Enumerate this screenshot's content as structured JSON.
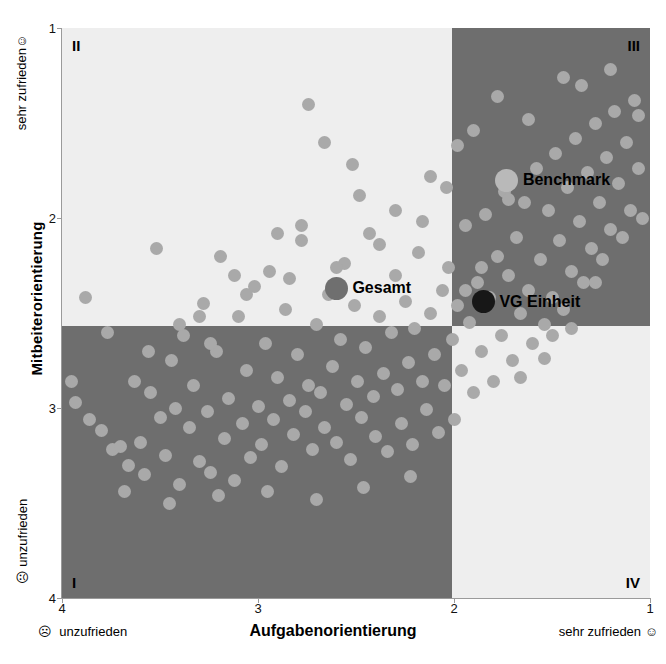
{
  "chart_data": {
    "type": "scatter",
    "title": "",
    "xlabel": "Aufgabenorientierung",
    "ylabel": "Mitbeiterorientierung",
    "xlim": [
      4,
      1
    ],
    "ylim": [
      4,
      1
    ],
    "x_ticks": [
      "4",
      "3",
      "2",
      "1"
    ],
    "y_ticks": [
      "1",
      "2",
      "3",
      "4"
    ],
    "x_tick_values": [
      4,
      3,
      2,
      1
    ],
    "y_tick_values": [
      1,
      2,
      3,
      4
    ],
    "grid": false,
    "axis_notes": {
      "x_left": "unzufrieden",
      "x_right": "sehr zufrieden",
      "y_top": "sehr zufrieden",
      "y_bottom": "unzufrieden",
      "smiley_sad": "☹",
      "smiley_happy": "☺"
    },
    "quadrants": [
      {
        "id": "II",
        "label": "II",
        "shade": "light",
        "color": "#eeeeee",
        "x_range": [
          4,
          2
        ],
        "y_range": [
          1,
          2.5
        ]
      },
      {
        "id": "III",
        "label": "III",
        "shade": "dark",
        "color": "#6e6e6e",
        "x_range": [
          2,
          1
        ],
        "y_range": [
          1,
          2.5
        ]
      },
      {
        "id": "I",
        "label": "I",
        "shade": "dark",
        "color": "#6e6e6e",
        "x_range": [
          4,
          2
        ],
        "y_range": [
          2.5,
          4
        ]
      },
      {
        "id": "IV",
        "label": "IV",
        "shade": "light",
        "color": "#eeeeee",
        "x_range": [
          2,
          1
        ],
        "y_range": [
          2.5,
          4
        ]
      }
    ],
    "point_color": "#a9a9a9",
    "series": [
      {
        "name": "Einheiten",
        "color": "#a9a9a9",
        "points": [
          [
            3.95,
            2.86
          ],
          [
            3.93,
            2.97
          ],
          [
            3.88,
            2.42
          ],
          [
            3.8,
            3.12
          ],
          [
            3.77,
            2.6
          ],
          [
            3.74,
            3.22
          ],
          [
            3.7,
            3.2
          ],
          [
            3.66,
            3.3
          ],
          [
            3.63,
            2.86
          ],
          [
            3.6,
            3.18
          ],
          [
            3.58,
            3.35
          ],
          [
            3.55,
            2.92
          ],
          [
            3.52,
            2.16
          ],
          [
            3.5,
            3.05
          ],
          [
            3.47,
            3.25
          ],
          [
            3.44,
            2.75
          ],
          [
            3.42,
            3.0
          ],
          [
            3.4,
            3.4
          ],
          [
            3.38,
            2.62
          ],
          [
            3.35,
            3.1
          ],
          [
            3.33,
            2.88
          ],
          [
            3.3,
            3.28
          ],
          [
            3.28,
            2.45
          ],
          [
            3.26,
            3.02
          ],
          [
            3.24,
            3.34
          ],
          [
            3.21,
            2.7
          ],
          [
            3.19,
            2.2
          ],
          [
            3.17,
            3.16
          ],
          [
            3.15,
            2.95
          ],
          [
            3.12,
            3.38
          ],
          [
            3.1,
            2.52
          ],
          [
            3.08,
            3.08
          ],
          [
            3.06,
            2.8
          ],
          [
            3.04,
            3.26
          ],
          [
            3.02,
            2.36
          ],
          [
            3.0,
            2.99
          ],
          [
            2.98,
            3.19
          ],
          [
            2.96,
            2.66
          ],
          [
            2.94,
            2.28
          ],
          [
            2.92,
            3.06
          ],
          [
            2.9,
            2.84
          ],
          [
            2.88,
            3.31
          ],
          [
            2.86,
            2.48
          ],
          [
            2.84,
            2.96
          ],
          [
            2.82,
            3.14
          ],
          [
            2.8,
            2.72
          ],
          [
            2.78,
            2.12
          ],
          [
            2.76,
            3.02
          ],
          [
            2.74,
            2.88
          ],
          [
            2.72,
            3.22
          ],
          [
            2.7,
            2.56
          ],
          [
            2.68,
            2.92
          ],
          [
            2.66,
            3.1
          ],
          [
            2.64,
            2.4
          ],
          [
            2.62,
            2.78
          ],
          [
            2.6,
            3.18
          ],
          [
            2.58,
            2.64
          ],
          [
            2.56,
            2.24
          ],
          [
            2.55,
            2.98
          ],
          [
            2.53,
            3.27
          ],
          [
            2.51,
            2.46
          ],
          [
            2.49,
            2.86
          ],
          [
            2.47,
            3.05
          ],
          [
            2.45,
            2.68
          ],
          [
            2.43,
            2.08
          ],
          [
            2.41,
            2.94
          ],
          [
            2.4,
            3.15
          ],
          [
            2.38,
            2.52
          ],
          [
            2.36,
            2.82
          ],
          [
            2.34,
            3.23
          ],
          [
            2.32,
            2.6
          ],
          [
            2.3,
            2.3
          ],
          [
            2.29,
            2.9
          ],
          [
            2.27,
            3.08
          ],
          [
            2.25,
            2.44
          ],
          [
            2.23,
            2.76
          ],
          [
            2.21,
            3.19
          ],
          [
            2.2,
            2.58
          ],
          [
            2.18,
            2.18
          ],
          [
            2.16,
            2.86
          ],
          [
            2.14,
            3.01
          ],
          [
            2.12,
            2.5
          ],
          [
            2.1,
            2.72
          ],
          [
            2.08,
            3.13
          ],
          [
            2.06,
            2.38
          ],
          [
            2.05,
            2.88
          ],
          [
            2.03,
            2.26
          ],
          [
            2.01,
            2.64
          ],
          [
            2.0,
            3.06
          ],
          [
            1.98,
            2.46
          ],
          [
            1.96,
            2.8
          ],
          [
            1.94,
            2.04
          ],
          [
            1.92,
            2.55
          ],
          [
            1.9,
            2.92
          ],
          [
            1.88,
            2.34
          ],
          [
            1.86,
            2.7
          ],
          [
            1.84,
            1.98
          ],
          [
            1.82,
            2.42
          ],
          [
            1.8,
            2.86
          ],
          [
            1.78,
            2.2
          ],
          [
            1.76,
            2.62
          ],
          [
            1.74,
            1.86
          ],
          [
            1.72,
            2.3
          ],
          [
            1.7,
            2.75
          ],
          [
            1.68,
            2.1
          ],
          [
            1.66,
            2.5
          ],
          [
            1.64,
            1.92
          ],
          [
            1.62,
            2.38
          ],
          [
            1.6,
            2.66
          ],
          [
            1.58,
            1.74
          ],
          [
            1.56,
            2.22
          ],
          [
            1.54,
            2.56
          ],
          [
            1.52,
            1.96
          ],
          [
            1.5,
            2.42
          ],
          [
            1.48,
            1.66
          ],
          [
            1.46,
            2.12
          ],
          [
            1.44,
            2.48
          ],
          [
            1.42,
            1.84
          ],
          [
            1.4,
            2.28
          ],
          [
            1.38,
            1.58
          ],
          [
            1.36,
            2.02
          ],
          [
            1.34,
            2.34
          ],
          [
            1.32,
            1.76
          ],
          [
            1.3,
            2.16
          ],
          [
            1.28,
            1.5
          ],
          [
            1.26,
            1.92
          ],
          [
            1.24,
            2.22
          ],
          [
            1.22,
            1.68
          ],
          [
            1.2,
            2.06
          ],
          [
            1.18,
            1.44
          ],
          [
            1.16,
            1.82
          ],
          [
            1.14,
            2.1
          ],
          [
            1.12,
            1.6
          ],
          [
            1.1,
            1.96
          ],
          [
            1.08,
            1.38
          ],
          [
            1.06,
            1.74
          ],
          [
            1.04,
            2.0
          ],
          [
            1.35,
            1.3
          ],
          [
            3.45,
            3.5
          ],
          [
            3.2,
            3.46
          ],
          [
            2.95,
            3.44
          ],
          [
            2.7,
            3.48
          ],
          [
            2.46,
            3.42
          ],
          [
            2.22,
            3.36
          ],
          [
            3.68,
            3.44
          ],
          [
            3.86,
            3.06
          ],
          [
            3.3,
            2.52
          ],
          [
            3.06,
            2.4
          ],
          [
            2.84,
            2.32
          ],
          [
            2.6,
            2.26
          ],
          [
            2.38,
            2.14
          ],
          [
            2.16,
            2.02
          ],
          [
            1.94,
            2.38
          ],
          [
            1.72,
            1.9
          ],
          [
            1.5,
            2.62
          ],
          [
            1.28,
            2.34
          ],
          [
            2.52,
            1.72
          ],
          [
            2.66,
            1.6
          ],
          [
            2.74,
            1.4
          ],
          [
            2.48,
            1.88
          ],
          [
            2.3,
            1.96
          ],
          [
            2.12,
            1.78
          ],
          [
            1.9,
            1.54
          ],
          [
            1.78,
            1.36
          ],
          [
            1.62,
            1.48
          ],
          [
            1.44,
            1.26
          ],
          [
            1.2,
            1.22
          ],
          [
            1.06,
            1.46
          ],
          [
            2.9,
            2.08
          ],
          [
            2.78,
            2.04
          ],
          [
            3.12,
            2.3
          ],
          [
            3.56,
            2.7
          ],
          [
            3.4,
            2.56
          ],
          [
            3.24,
            2.66
          ],
          [
            2.04,
            1.84
          ],
          [
            1.98,
            1.62
          ],
          [
            1.86,
            2.26
          ],
          [
            1.66,
            2.84
          ],
          [
            1.54,
            2.74
          ],
          [
            1.4,
            2.58
          ]
        ]
      }
    ],
    "highlights": [
      {
        "name": "Gesamt",
        "x": 2.6,
        "y": 2.37,
        "color": "#6f6f6f",
        "label_side": "right"
      },
      {
        "name": "VG Einheit",
        "x": 1.85,
        "y": 2.44,
        "color": "#171717",
        "label_side": "right"
      },
      {
        "name": "Benchmark",
        "x": 1.73,
        "y": 1.8,
        "color": "#b9b9b9",
        "label_side": "right"
      }
    ]
  }
}
